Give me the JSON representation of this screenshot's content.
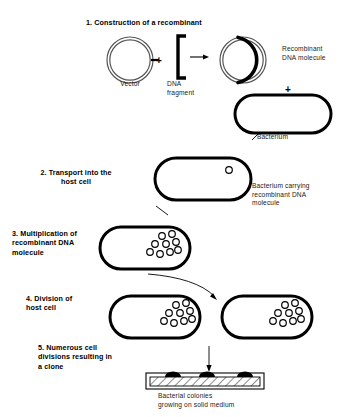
{
  "diagram": {
    "steps": [
      {
        "number": "1",
        "label": "1. Construction of a recombinant"
      },
      {
        "number": "2",
        "label": "2. Transport into the\nhost cell"
      },
      {
        "number": "3",
        "label": "3. Multiplication of\nrecombinant DNA\nmolecule"
      },
      {
        "number": "4",
        "label": "4. Division of\nhost cell"
      },
      {
        "number": "5",
        "label": "5. Numerous cell\ndivisions resulting in\na clone"
      }
    ],
    "captions": {
      "vector": "Vector",
      "dna_fragment": "DNA\nfragment",
      "recombinant": "Recombinant\nDNA molecule",
      "bacterium": "Bacterium",
      "bacterium_carrying": "Bacterium carrying\nrecombinant DNA\nmolecule",
      "colonies": "Bacterial colonies\ngrowing on solid medium"
    },
    "symbols": {
      "plus_vector_fragment": "+",
      "plus_recombinant_bacterium": "+"
    },
    "counts": {
      "plasmids_step2": 1,
      "plasmids_step3": 9,
      "plasmids_step4_left": 9,
      "plasmids_step4_right": 9,
      "colonies_on_plate": 3
    },
    "colors": {
      "ink": "#000000",
      "plasmid_outline": "#4d4d4d",
      "insert_highlight": "#000000",
      "background": "#ffffff"
    }
  }
}
